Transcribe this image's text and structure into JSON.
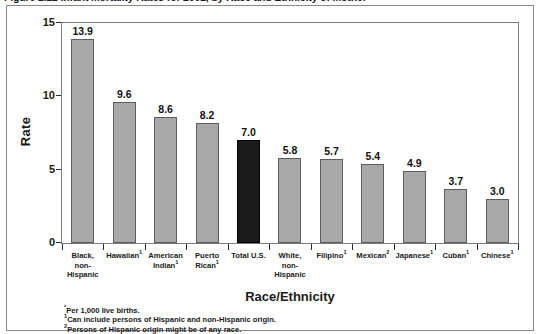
{
  "figure": {
    "caption": "Figure 2.22 Infant Mortality Rates for 2002, by Race and Ethnicity of Mother"
  },
  "footnotes": [
    {
      "marker": "*",
      "text": "Per 1,000 live births."
    },
    {
      "marker": "1",
      "text": "Can include persons of Hispanic and non-Hispanic origin."
    },
    {
      "marker": "2",
      "text": "Persons of Hispanic origin might be of any race."
    }
  ],
  "colors": {
    "bar_fill": "#a8a8a8",
    "bar_stroke": "#5d5d5d",
    "highlight_fill": "#1b1b1b",
    "axis": "#2b2b2b",
    "frame": "#8a8a8a",
    "background": "#ffffff"
  },
  "chart_data": {
    "type": "bar",
    "title": "Figure 2.22 Infant Mortality Rates for 2002, by Race and Ethnicity of Mother",
    "xlabel": "Race/Ethnicity",
    "ylabel": "Rate",
    "ylim": [
      0,
      15
    ],
    "yticks": [
      0,
      5,
      10,
      15
    ],
    "grid": false,
    "legend": false,
    "categories": [
      "Black, non-Hispanic",
      "Hawaiian",
      "American Indian",
      "Puerto Rican",
      "Total U.S.",
      "White, non-Hispanic",
      "Filipino",
      "Mexican",
      "Japanese",
      "Cuban",
      "Chinese"
    ],
    "category_labels": [
      {
        "lines": [
          "Black,",
          "non-",
          "Hispanic"
        ],
        "marker": ""
      },
      {
        "lines": [
          "Hawaiian"
        ],
        "marker": "1"
      },
      {
        "lines": [
          "American",
          "Indian"
        ],
        "marker": "1"
      },
      {
        "lines": [
          "Puerto",
          "Rican"
        ],
        "marker": "1"
      },
      {
        "lines": [
          "Total U.S."
        ],
        "marker": ""
      },
      {
        "lines": [
          "White,",
          "non-",
          "Hispanic"
        ],
        "marker": ""
      },
      {
        "lines": [
          "Filipino"
        ],
        "marker": "1"
      },
      {
        "lines": [
          "Mexican"
        ],
        "marker": "2"
      },
      {
        "lines": [
          "Japanese"
        ],
        "marker": "1"
      },
      {
        "lines": [
          "Cuban"
        ],
        "marker": "1"
      },
      {
        "lines": [
          "Chinese"
        ],
        "marker": "1"
      }
    ],
    "values": [
      13.9,
      9.6,
      8.6,
      8.2,
      7.0,
      5.8,
      5.7,
      5.4,
      4.9,
      3.7,
      3.0
    ],
    "value_labels": [
      "13.9",
      "9.6",
      "8.6",
      "8.2",
      "7.0",
      "5.8",
      "5.7",
      "5.4",
      "4.9",
      "3.7",
      "3.0"
    ],
    "highlight_index": 4
  }
}
